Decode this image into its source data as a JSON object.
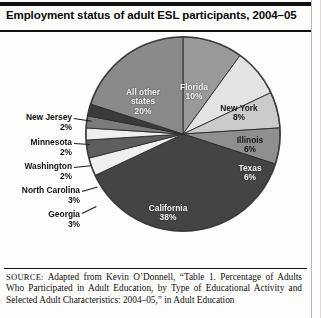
{
  "figure": {
    "title": "Employment status of adult ESL participants, 2004–05"
  },
  "chart_data": {
    "type": "pie",
    "title": "Employment status of adult ESL participants, 2004–05",
    "xlabel": "",
    "ylabel": "",
    "unit": "percent",
    "start_angle_deg": 0,
    "direction": "clockwise",
    "legend": "none (direct labels)",
    "categories": [
      "Florida",
      "New York",
      "Illinois",
      "Texas",
      "California",
      "Georgia",
      "North Carolina",
      "Washington",
      "Minnesota",
      "New Jersey",
      "All other states"
    ],
    "values": [
      10,
      8,
      6,
      6,
      38,
      3,
      3,
      2,
      2,
      2,
      20
    ],
    "total": 100,
    "slices": [
      {
        "label": "Florida",
        "value": 10,
        "value_text": "10%",
        "color": "#9a9a9a",
        "label_color": "#f2f2f2",
        "label_placement": "inside"
      },
      {
        "label": "New York",
        "value": 8,
        "value_text": "8%",
        "color": "#e4e4e4",
        "label_color": "#171717",
        "label_placement": "inside"
      },
      {
        "label": "Illinois",
        "value": 6,
        "value_text": "6%",
        "color": "#cbcbcb",
        "label_color": "#171717",
        "label_placement": "inside"
      },
      {
        "label": "Texas",
        "value": 6,
        "value_text": "6%",
        "color": "#8f8f8f",
        "label_color": "#efefef",
        "label_placement": "inside"
      },
      {
        "label": "California",
        "value": 38,
        "value_text": "38%",
        "color": "#444444",
        "label_color": "#f2f2f2",
        "label_placement": "inside"
      },
      {
        "label": "Georgia",
        "value": 3,
        "value_text": "3%",
        "color": "#efefef",
        "label_color": "#121212",
        "label_placement": "outside"
      },
      {
        "label": "North Carolina",
        "value": 3,
        "value_text": "3%",
        "color": "#5e5e5e",
        "label_color": "#121212",
        "label_placement": "outside"
      },
      {
        "label": "Washington",
        "value": 2,
        "value_text": "2%",
        "color": "#efefef",
        "label_color": "#121212",
        "label_placement": "outside"
      },
      {
        "label": "Minnesota",
        "value": 2,
        "value_text": "2%",
        "color": "#7b7b7b",
        "label_color": "#121212",
        "label_placement": "outside"
      },
      {
        "label": "New Jersey",
        "value": 2,
        "value_text": "2%",
        "color": "#3a3a3a",
        "label_color": "#121212",
        "label_placement": "outside"
      },
      {
        "label": "All other states",
        "value": 20,
        "value_text": "20%",
        "color": "#8a8a8a",
        "label_color": "#f2f2f2",
        "label_placement": "inside"
      }
    ],
    "labels_inside": [
      {
        "name": "all-other-states",
        "text": "All other\nstates\n20%"
      },
      {
        "name": "florida",
        "text": "Florida\n10%"
      },
      {
        "name": "new-york",
        "text": "New York\n8%"
      },
      {
        "name": "illinois",
        "text": "Illinois\n6%"
      },
      {
        "name": "texas",
        "text": "Texas\n6%"
      },
      {
        "name": "california",
        "text": "California\n38%"
      }
    ],
    "labels_outside": [
      {
        "name": "new-jersey",
        "text": "New Jersey\n2%"
      },
      {
        "name": "minnesota",
        "text": "Minnesota\n2%"
      },
      {
        "name": "washington",
        "text": "Washington\n2%"
      },
      {
        "name": "north-carolina",
        "text": "North Carolina\n3%"
      },
      {
        "name": "georgia",
        "text": "Georgia\n3%"
      }
    ]
  },
  "source": {
    "prefix": "SOURCE:",
    "text": " Adapted from Kevin O’Donnell, “Table 1. Percentage of Adults Who Participated in Adult Education, by Type of Educational Activity and Selected Adult Characteristics: 2004–05,” in Adult Education"
  }
}
